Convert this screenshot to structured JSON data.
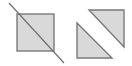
{
  "diagram": {
    "colors": {
      "fill": "#d9d9d9",
      "stroke": "#7a7a7a",
      "line": "#6f6f6f",
      "background": "#ffffff"
    },
    "square": {
      "x": 17,
      "y": 14,
      "width": 37,
      "height": 37
    },
    "cut_line": {
      "x1": 9,
      "y1": 3,
      "x2": 64,
      "y2": 63
    },
    "triangles": [
      {
        "name": "upper-right-triangle",
        "points": "89,10 124,10 124,47"
      },
      {
        "name": "lower-left-triangle",
        "points": "77,23 77,58 112,58"
      }
    ]
  }
}
